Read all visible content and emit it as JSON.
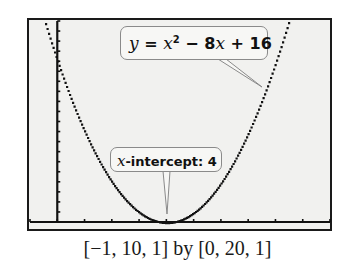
{
  "chart_data": {
    "type": "line",
    "title": "",
    "function": "y = x^2 - 8x + 16",
    "x": [
      -1,
      0,
      1,
      2,
      3,
      4,
      5,
      6,
      7,
      8,
      9,
      10
    ],
    "values": [
      25,
      16,
      9,
      4,
      1,
      0,
      1,
      4,
      9,
      16,
      25,
      36
    ],
    "xlim": [
      -1,
      10
    ],
    "xscl": 1,
    "ylim": [
      0,
      20
    ],
    "yscl": 1,
    "xlabel": "",
    "ylabel": "",
    "grid": false,
    "annotations": [
      {
        "text": "y = x² − 8x + 16",
        "points_to": [
          7.6,
          13.4
        ]
      },
      {
        "text": "x-intercept: 4",
        "points_to": [
          4,
          0
        ]
      }
    ]
  },
  "callouts": {
    "equation": {
      "y": "y",
      "eq": " = ",
      "x1": "x",
      "sq": "2",
      "rest1": " − 8",
      "x2": "x",
      "rest2": " + 16"
    },
    "intercept": {
      "x": "x",
      "label": "-intercept: 4"
    }
  },
  "caption": "[−1, 10, 1] by [0, 20, 1]",
  "colors": {
    "screen_bg": "#f1f1ef",
    "plot": "#111111",
    "border": "#1a1a1a"
  }
}
